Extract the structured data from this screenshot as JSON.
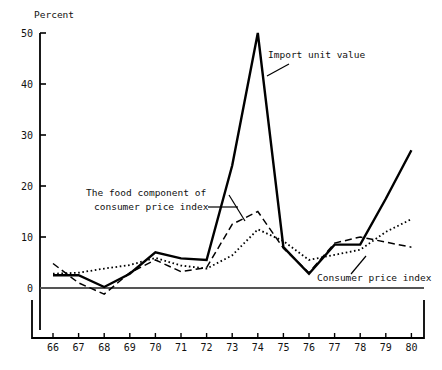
{
  "chart_data": {
    "type": "line",
    "title": "",
    "ylabel": "Percent",
    "xlabel": "",
    "grid": false,
    "legend_position": "inline-annotations",
    "ylim": [
      0,
      50
    ],
    "xlim": [
      66,
      80
    ],
    "ytick_labels": [
      "0",
      "10",
      "20",
      "30",
      "40",
      "50"
    ],
    "ytick_values": [
      0,
      10,
      20,
      30,
      40,
      50
    ],
    "categories": [
      "66",
      "67",
      "68",
      "69",
      "70",
      "71",
      "72",
      "73",
      "74",
      "75",
      "76",
      "77",
      "78",
      "79",
      "80"
    ],
    "x": [
      66,
      67,
      68,
      69,
      70,
      71,
      72,
      73,
      74,
      75,
      76,
      77,
      78,
      79,
      80
    ],
    "series": [
      {
        "name": "Import unit value",
        "style": "solid",
        "values": [
          2.5,
          2.5,
          0.2,
          2.8,
          7.0,
          5.8,
          5.5,
          24.0,
          50.0,
          8.0,
          2.8,
          8.5,
          8.5,
          17.5,
          27.0
        ]
      },
      {
        "name": "The food component of consumer price index",
        "style": "dashed",
        "values": [
          4.8,
          1.0,
          -1.2,
          3.0,
          5.5,
          3.2,
          4.0,
          12.5,
          15.0,
          7.8,
          3.0,
          8.8,
          10.0,
          9.0,
          8.0
        ]
      },
      {
        "name": "Consumer price index",
        "style": "dotted",
        "values": [
          2.8,
          3.0,
          3.8,
          4.5,
          5.9,
          4.4,
          3.8,
          6.4,
          11.5,
          9.2,
          5.5,
          6.5,
          7.5,
          11.0,
          13.5
        ]
      }
    ],
    "annotations": [
      {
        "id": "import-unit-value",
        "text": "Import unit value",
        "x_px": 268,
        "y_px": 58
      },
      {
        "id": "food-component-line1",
        "text": "The food component of",
        "x_px": 86,
        "y_px": 196
      },
      {
        "id": "food-component-line2",
        "text": "consumer price index",
        "x_px": 94,
        "y_px": 210
      },
      {
        "id": "consumer-price-index",
        "text": "Consumer price index",
        "x_px": 317,
        "y_px": 281
      }
    ]
  }
}
